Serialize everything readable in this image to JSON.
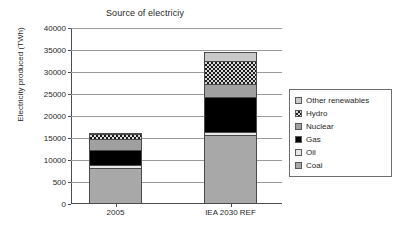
{
  "chart_data": {
    "type": "bar",
    "subtype": "stacked-column",
    "title": "Source of electriciy",
    "xlabel": "",
    "ylabel": "Electricity produced (TWh)",
    "categories": [
      "2005",
      "IEA 2030 REF"
    ],
    "ylim": [
      0,
      40000
    ],
    "ytick_labels": [
      "40000",
      "35000",
      "30000",
      "25000",
      "20000",
      "15000",
      "10000",
      "500",
      "0"
    ],
    "ytick_values": [
      40000,
      35000,
      30000,
      25000,
      20000,
      15000,
      10000,
      5000,
      0
    ],
    "grid": "horizontal",
    "legend_position": "right",
    "series": [
      {
        "name": "Coal",
        "values": [
          8200,
          15700
        ],
        "color": "#a8a8a8",
        "pattern": "solid"
      },
      {
        "name": "Oil",
        "values": [
          1000,
          900
        ],
        "color": "#e8e8e8",
        "pattern": "solid"
      },
      {
        "name": "Gas",
        "values": [
          3600,
          8200
        ],
        "color": "#000000",
        "pattern": "solid"
      },
      {
        "name": "Nuclear",
        "values": [
          2700,
          3200
        ],
        "color": "#a0a0a0",
        "pattern": "solid"
      },
      {
        "name": "Hydro",
        "values": [
          1400,
          5400
        ],
        "color": "#d8d8d8",
        "pattern": "checkerboard"
      },
      {
        "name": "Other renewables",
        "values": [
          400,
          2300
        ],
        "color": "#c9c9c9",
        "pattern": "solid"
      }
    ],
    "totals": [
      17300,
      35700
    ],
    "legend_order": [
      "Other renewables",
      "Hydro",
      "Nuclear",
      "Gas",
      "Oil",
      "Coal"
    ]
  },
  "legend": {
    "items": [
      {
        "label": "Other renewables",
        "swatch": "other"
      },
      {
        "label": "Hydro",
        "swatch": "hydro"
      },
      {
        "label": "Nuclear",
        "swatch": "nuclear"
      },
      {
        "label": "Gas",
        "swatch": "gas"
      },
      {
        "label": "Oil",
        "swatch": "oil"
      },
      {
        "label": "Coal",
        "swatch": "coal"
      }
    ]
  }
}
